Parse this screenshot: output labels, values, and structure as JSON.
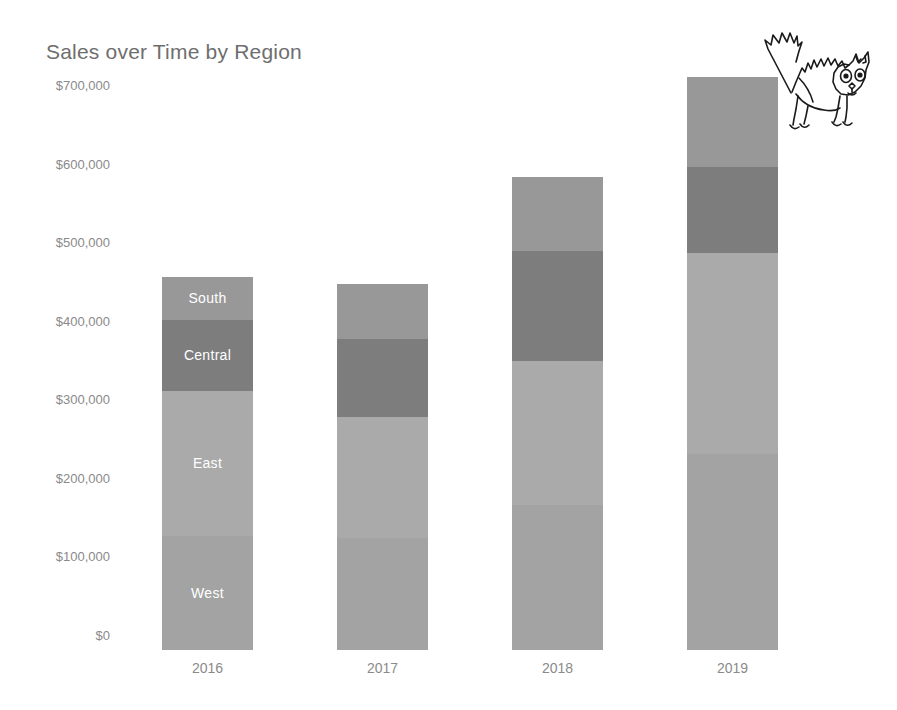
{
  "chart": {
    "title": "Sales over Time by Region"
  },
  "annotation": {
    "doodle_name": "scared-cat-drawing"
  },
  "chart_data": {
    "type": "bar",
    "subtype": "stacked",
    "title": "Sales over Time by Region",
    "xlabel": "",
    "ylabel": "",
    "categories": [
      "2016",
      "2017",
      "2018",
      "2019"
    ],
    "series": [
      {
        "name": "West",
        "color": "#a3a3a3",
        "values": [
          145000,
          143000,
          185000,
          250000
        ]
      },
      {
        "name": "East",
        "color": "#aaaaaa",
        "values": [
          185000,
          153000,
          183000,
          255000
        ]
      },
      {
        "name": "Central",
        "color": "#7d7d7d",
        "values": [
          90000,
          100000,
          140000,
          110000
        ]
      },
      {
        "name": "South",
        "color": "#989898",
        "values": [
          55000,
          70000,
          94000,
          114000
        ]
      }
    ],
    "totals": [
      475000,
      466000,
      602000,
      729000
    ],
    "ylim": [
      0,
      700000
    ],
    "ytick_values": [
      0,
      100000,
      200000,
      300000,
      400000,
      500000,
      600000,
      700000
    ],
    "ytick_labels": [
      "$0",
      "$100,000",
      "$200,000",
      "$300,000",
      "$400,000",
      "$500,000",
      "$600,000",
      "$700,000"
    ],
    "grid": false,
    "legend": "none",
    "segment_labels_shown_on": "2016",
    "background": "#ffffff",
    "title_color": "#6e6e6e",
    "tick_color": "#8a8a8a"
  }
}
